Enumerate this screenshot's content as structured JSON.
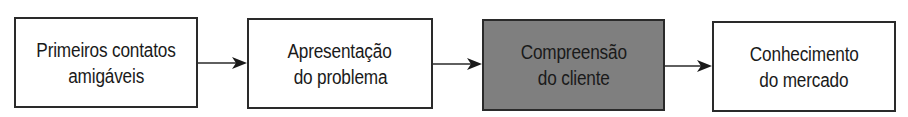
{
  "diagram": {
    "type": "flowchart",
    "direction": "left-to-right",
    "nodes": [
      {
        "id": "n1",
        "lines": [
          "Primeiros contatos",
          "amigáveis"
        ],
        "highlighted": false
      },
      {
        "id": "n2",
        "lines": [
          "Apresentação",
          "do problema"
        ],
        "highlighted": false
      },
      {
        "id": "n3",
        "lines": [
          "Compreensão",
          "do cliente"
        ],
        "highlighted": true
      },
      {
        "id": "n4",
        "lines": [
          "Conhecimento",
          "do mercado"
        ],
        "highlighted": false
      }
    ],
    "edges": [
      {
        "from": "n1",
        "to": "n2"
      },
      {
        "from": "n2",
        "to": "n3"
      },
      {
        "from": "n3",
        "to": "n4"
      }
    ],
    "colors": {
      "border": "#2a2a2a",
      "box_fill": "#ffffff",
      "highlight_fill": "#7f7f7f",
      "text": "#1a1a1a"
    }
  }
}
